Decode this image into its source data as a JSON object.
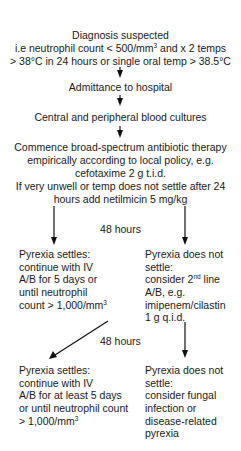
{
  "flowchart": {
    "start": {
      "title": "Diagnosis suspected",
      "line2_pre": "i.e neutrophil count < 500/mm",
      "line2_sup": "3",
      "line2_post": " and x 2 temps",
      "line3": "> 38°C in 24 hours or single oral temp > 38.5°C"
    },
    "step_admit": "Admittance to hospital",
    "step_cultures": "Central and peripheral blood cultures",
    "step_therapy": {
      "lines": [
        "Commence broad-spectrum antibiotic therapy",
        "empirically according to local policy, e.g.",
        "cefotaxime 2 g t.i.d.",
        "If very unwell or temp does not settle after 24",
        "hours add netilmicin 5 mg/kg"
      ]
    },
    "interval_1": "48 hours",
    "branch1_settles": {
      "lines": [
        "Pyrexia settles:",
        "continue with IV",
        "A/B for 5 days or",
        "until neutrophil"
      ],
      "last_pre": "count > 1,000/mm",
      "last_sup": "3"
    },
    "branch1_not_settle": {
      "line1": "Pyrexia does not",
      "line2": "settle:",
      "line3_pre": "consider 2",
      "line3_sup": "nd",
      "line3_post": " line",
      "lines_rest": [
        "A/B, e.g.",
        "imipenem/cilastin",
        "1 g q.i.d."
      ]
    },
    "interval_2": "48 hours",
    "branch2_settles": {
      "lines": [
        "Pyrexia settles:",
        "continue with IV",
        "A/B for at least 5 days",
        "or until neutrophil count"
      ],
      "last_pre": "> 1,000/mm",
      "last_sup": "3"
    },
    "branch2_not_settle": {
      "lines": [
        "Pyrexia does not",
        "settle:",
        "consider fungal",
        "infection or",
        "disease-related",
        "pyrexia"
      ]
    },
    "colors": {
      "text": "#1a1a1a",
      "arrow": "#111111",
      "background": "#ffffff"
    }
  }
}
